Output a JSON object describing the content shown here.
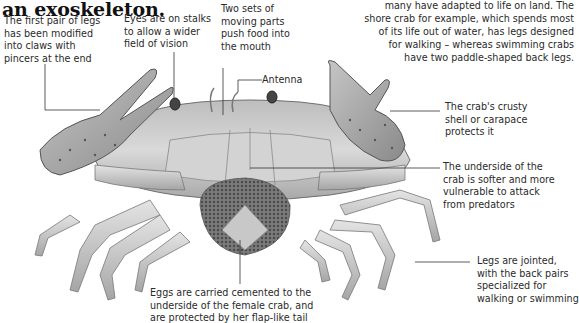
{
  "heading": "an exoskeleton.",
  "intro_lines": [
    "many have adapted to life on land. The",
    "shore crab for example, which spends most",
    "of its life out of water, has legs designed",
    "for walking – whereas swimming crabs",
    "have two paddle-shaped back legs."
  ],
  "annotations": {
    "claws": [
      "The first pair of legs",
      "has been modified",
      "into claws with",
      "pincers at the end"
    ],
    "eyes": [
      "Eyes are on stalks",
      "to allow a wider",
      "field of vision"
    ],
    "mouthparts": [
      "Two sets of",
      "moving parts",
      "push food into",
      "the mouth"
    ],
    "antenna": "Antenna",
    "shell": [
      "The crab's crusty",
      "shell or carapace",
      "protects it"
    ],
    "underside": [
      "The underside of the",
      "crab is softer and more",
      "vulnerable to attack",
      "from predators"
    ],
    "legs": [
      "Legs are jointed,",
      "with the back pairs",
      "specialized for",
      "walking or swimming"
    ],
    "eggs": [
      "Eggs are carried cemented to the",
      "underside of the female crab, and",
      "are protected by her flap-like tail"
    ]
  },
  "colors": {
    "shell": "#c9c9c9",
    "shell_dark": "#8f8f8f",
    "eggs": "#6e6e6e",
    "line": "#333333"
  }
}
